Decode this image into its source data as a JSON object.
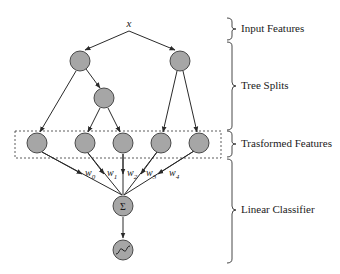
{
  "diagram": {
    "input_label": "x",
    "node_fill": "#a6a6a6",
    "node_stroke": "#3a3a3a",
    "edge_color": "#2a2a2a",
    "tree_nodes": [
      {
        "id": "t1",
        "cx": 80,
        "cy": 61
      },
      {
        "id": "t2",
        "cx": 180,
        "cy": 61
      },
      {
        "id": "t3",
        "cx": 104,
        "cy": 98
      }
    ],
    "leaf_nodes": [
      {
        "id": "l0",
        "cx": 37,
        "cy": 143
      },
      {
        "id": "l1",
        "cx": 85,
        "cy": 143
      },
      {
        "id": "l2",
        "cx": 123,
        "cy": 143
      },
      {
        "id": "l3",
        "cx": 161,
        "cy": 143
      },
      {
        "id": "l4",
        "cx": 199,
        "cy": 143
      }
    ],
    "weights": [
      "w0",
      "w1",
      "w2",
      "w3",
      "w4"
    ],
    "weight_labels": [
      {
        "base": "w",
        "sub": "0"
      },
      {
        "base": "w",
        "sub": "1"
      },
      {
        "base": "w",
        "sub": "2"
      },
      {
        "base": "w",
        "sub": "3"
      },
      {
        "base": "w",
        "sub": "4"
      }
    ],
    "sum_node": {
      "cx": 123,
      "cy": 206,
      "symbol": "Σ"
    },
    "sigmoid_node": {
      "cx": 123,
      "cy": 250
    }
  },
  "sections": [
    {
      "label": "Input Features"
    },
    {
      "label": "Tree Splits"
    },
    {
      "label": "Trasformed Features"
    },
    {
      "label": "Linear Classifier"
    }
  ]
}
